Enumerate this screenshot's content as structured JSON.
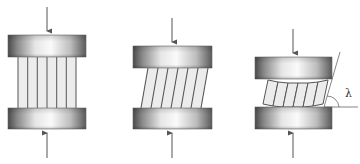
{
  "diagram": {
    "colors": {
      "plate_dark": "#4a4a4a",
      "plate_light": "#f4f4f4",
      "strip_fill": "#ececec",
      "strip_line": "#555555",
      "arrow": "#555555",
      "angle_line": "#666666"
    },
    "panels": [
      {
        "id": "undeformed",
        "top_plate": {
          "x": 8,
          "y": 35,
          "w": 78,
          "h": 22
        },
        "bottom_plate": {
          "x": 8,
          "y": 108,
          "w": 78,
          "h": 21
        },
        "strips": {
          "count": 6,
          "x0": 18,
          "x1": 76,
          "shear": 0
        },
        "arrow_x": 47,
        "arrow_top": [
          7,
          31
        ],
        "arrow_bottom": [
          158,
          133
        ]
      },
      {
        "id": "sheared",
        "top_plate": {
          "x": 133,
          "y": 46,
          "w": 79,
          "h": 22
        },
        "bottom_plate": {
          "x": 133,
          "y": 108,
          "w": 79,
          "h": 21
        },
        "strips": {
          "count": 6,
          "x0": 141,
          "x1": 201,
          "shear": 7
        },
        "arrow_x": 172,
        "arrow_top": [
          18,
          42
        ],
        "arrow_bottom": [
          158,
          133
        ]
      },
      {
        "id": "rotated",
        "top_plate": {
          "x": 255,
          "y": 57,
          "w": 77,
          "h": 22
        },
        "bottom_plate": {
          "x": 255,
          "y": 107,
          "w": 77,
          "h": 22
        },
        "strips": {
          "count": 6,
          "x0": 263,
          "x1": 323,
          "shear": 6
        },
        "arrow_x": 293,
        "arrow_top": [
          29,
          53
        ],
        "arrow_bottom": [
          158,
          133
        ],
        "angle": {
          "label": "λ",
          "vertex": [
            328,
            107
          ],
          "ray_end": [
            340,
            52
          ],
          "base_end": [
            358,
            107
          ],
          "label_pos": [
            345,
            96
          ]
        }
      }
    ]
  }
}
